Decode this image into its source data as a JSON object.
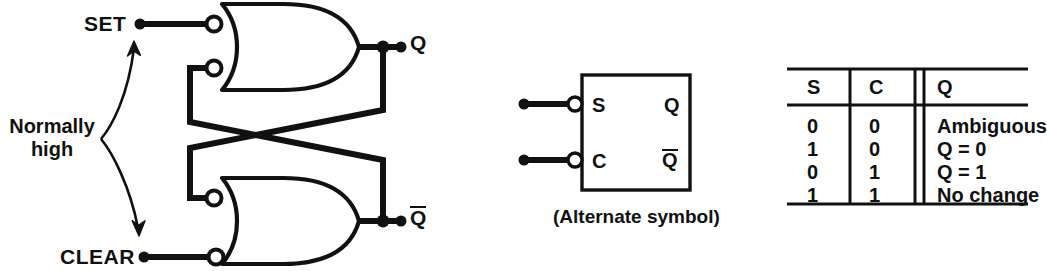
{
  "figure": {
    "type": "logic-circuit-diagram"
  },
  "circuit": {
    "inputs": [
      {
        "name": "set-input",
        "label": "SET"
      },
      {
        "name": "clear-input",
        "label": "CLEAR"
      }
    ],
    "outputs": [
      {
        "name": "q-output",
        "label": "Q"
      },
      {
        "name": "qbar-output",
        "label": "Q",
        "overline": true
      }
    ],
    "annotation": {
      "label": "Normally\nhigh",
      "line1": "Normally",
      "line2": "high",
      "arrow": "double-headed-curved"
    },
    "gates": [
      {
        "name": "nor-gate-top",
        "type": "or-gate-inverted-inputs",
        "inputs": 2
      },
      {
        "name": "nor-gate-bottom",
        "type": "or-gate-inverted-inputs",
        "inputs": 2
      }
    ]
  },
  "alternate_symbol": {
    "caption": "(Alternate symbol)",
    "input_labels": {
      "s": "S",
      "c": "C"
    },
    "output_labels": {
      "q": "Q",
      "qbar": "Q"
    },
    "qbar_overline": true
  },
  "truth_table": {
    "headers": [
      "S",
      "C",
      "Q"
    ],
    "rows": [
      {
        "s": "0",
        "c": "0",
        "q": "Ambiguous"
      },
      {
        "s": "1",
        "c": "0",
        "q": "Q = 0"
      },
      {
        "s": "0",
        "c": "1",
        "q": "Q = 1"
      },
      {
        "s": "1",
        "c": "1",
        "q": "No change"
      }
    ]
  },
  "colors": {
    "ink": "#111111",
    "background": "#ffffff"
  }
}
